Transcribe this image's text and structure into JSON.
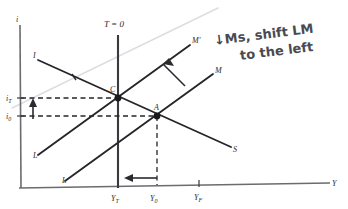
{
  "figure": {
    "kind": "is-lm-diagram",
    "background_color": "#ffffff",
    "ink_color": "#2b2b2b",
    "handwriting_color": "#4a4a52",
    "faint_line_color": "#d8d8dc"
  },
  "axes": {
    "y_axis_label": "i",
    "x_axis_label": "Y",
    "x_ticks": [
      {
        "id": "yt",
        "label": "Y",
        "sub": "T"
      },
      {
        "id": "y0",
        "label": "Y",
        "sub": "0"
      },
      {
        "id": "yf",
        "label": "Y",
        "sub": "F"
      }
    ],
    "y_ticks": [
      {
        "id": "it",
        "label": "i",
        "sub": "T"
      },
      {
        "id": "i0",
        "label": "i",
        "sub": "0"
      }
    ]
  },
  "curves": [
    {
      "id": "is-curve",
      "start_label": "I",
      "end_label": "S",
      "name": "IS curve"
    },
    {
      "id": "lm-curve",
      "start_label": "L",
      "end_label": "M",
      "name": "LM curve"
    },
    {
      "id": "lm-prime-curve",
      "start_label": "L",
      "end_label": "M'",
      "name": "LM' curve shifted left"
    }
  ],
  "vertical_line": {
    "id": "full-employment-line",
    "label": "T = 0"
  },
  "points": [
    {
      "id": "point-c",
      "label": "C"
    },
    {
      "id": "point-a",
      "label": "A"
    }
  ],
  "annotation": {
    "line1": "↓Ms, shift LM",
    "line2": "to the left"
  },
  "arrows": [
    {
      "id": "lm-shift-arrow",
      "meaning": "LM curve shifts up-left"
    },
    {
      "id": "interest-rate-rise-arrow",
      "meaning": "interest rate rises from i0 to iT"
    },
    {
      "id": "output-fall-arrow",
      "meaning": "output falls from Y0 to YT"
    }
  ]
}
